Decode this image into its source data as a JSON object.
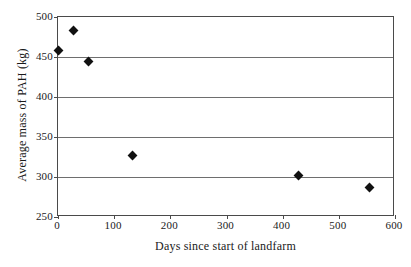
{
  "chart_data": {
    "type": "scatter",
    "title": "",
    "xlabel": "Days since start of landfarm",
    "ylabel": "Average mass of PAH (kg)",
    "xlim": [
      0,
      600
    ],
    "ylim": [
      250,
      500
    ],
    "xticks": [
      0,
      100,
      200,
      300,
      400,
      500,
      600
    ],
    "yticks": [
      250,
      300,
      350,
      400,
      450,
      500
    ],
    "xtick_labels": [
      "0",
      "100",
      "200",
      "300",
      "400",
      "500",
      "600"
    ],
    "ytick_labels": [
      "250",
      "300",
      "350",
      "400",
      "450",
      "500"
    ],
    "grid": "horizontal",
    "legend": null,
    "marker": "filled-diamond",
    "marker_color": "#111111",
    "series": [
      {
        "name": "Average mass of PAH",
        "points": [
          {
            "x": 0,
            "y": 458
          },
          {
            "x": 28,
            "y": 483
          },
          {
            "x": 55,
            "y": 444
          },
          {
            "x": 133,
            "y": 327
          },
          {
            "x": 428,
            "y": 302
          },
          {
            "x": 555,
            "y": 287
          }
        ]
      }
    ]
  },
  "colors": {
    "axis": "#4a4a4a",
    "gridline": "#6e6e6e",
    "marker": "#111111",
    "background": "#ffffff",
    "text": "#1a1a1a"
  }
}
